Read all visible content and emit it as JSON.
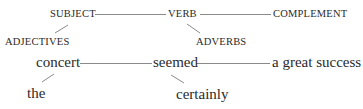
{
  "diagram": {
    "type": "sentence-diagram",
    "template_row": {
      "subject": "SUBJECT",
      "verb": "VERB",
      "complement": "COMPLEMENT",
      "subject_modifier": "ADJECTIVES",
      "verb_modifier": "ADVERBS"
    },
    "example_row": {
      "subject": "concert",
      "verb": "seemed",
      "complement": "a great success",
      "subject_modifier": "the",
      "verb_modifier": "certainly"
    },
    "colors": {
      "text": "#2a2a2a",
      "line": "#8a8a8a",
      "background": "#ffffff"
    }
  }
}
